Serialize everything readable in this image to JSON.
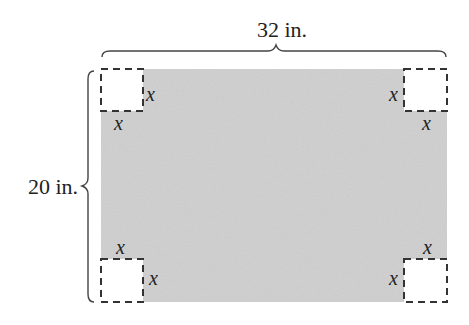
{
  "diagram": {
    "width_label": "32 in.",
    "height_label": "20 in.",
    "corner_variable": "x",
    "sheet_color": "#c9c9c9",
    "corners": [
      {
        "position": "top-left",
        "labels": [
          "x",
          "x"
        ]
      },
      {
        "position": "top-right",
        "labels": [
          "x",
          "x"
        ]
      },
      {
        "position": "bottom-left",
        "labels": [
          "x",
          "x"
        ]
      },
      {
        "position": "bottom-right",
        "labels": [
          "x",
          "x"
        ]
      }
    ]
  }
}
